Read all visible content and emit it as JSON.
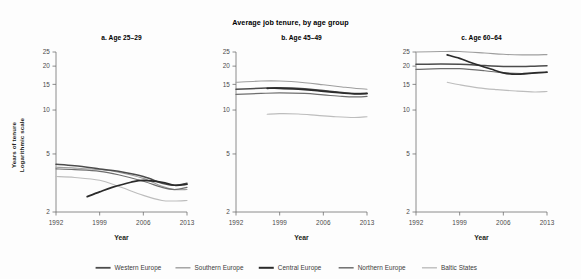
{
  "figure": {
    "title": "Average job tenure, by age group",
    "y_axis_title_line1": "Years of tenure",
    "y_axis_title_line2": "Logarithmic scale",
    "x_axis_title": "Year"
  },
  "colors": {
    "western_europe": "#4c4c4c",
    "southern_europe": "#9e9e9e",
    "central_europe": "#2b2b2b",
    "northern_europe": "#6e6e6e",
    "baltic_states": "#bdbdbd",
    "axis": "#6f6f6f",
    "text": "#231f20",
    "background": "#fdfdfd"
  },
  "legend": {
    "position": "bottom",
    "items": [
      {
        "label": "Western Europe",
        "color": "#4c4c4c",
        "width": 1.5
      },
      {
        "label": "Southern Europe",
        "color": "#9e9e9e",
        "width": 1.1
      },
      {
        "label": "Central Europe",
        "color": "#2b2b2b",
        "width": 1.7
      },
      {
        "label": "Northern Europe",
        "color": "#6e6e6e",
        "width": 1.2
      },
      {
        "label": "Baltic States",
        "color": "#bdbdbd",
        "width": 1.1
      }
    ]
  },
  "chart_data": {
    "type": "line",
    "xlabel": "Year",
    "ylabel": "Years of tenure Logarithmic scale",
    "yscale": "log",
    "xlim": [
      1992,
      2013
    ],
    "ylim": [
      2,
      25
    ],
    "xticks": [
      1992,
      1999,
      2006,
      2013
    ],
    "yticks": [
      2,
      5,
      10,
      15,
      20,
      25
    ],
    "grid": false,
    "legend_position": "bottom",
    "panels": [
      {
        "id": "a",
        "title": "a. Age 25–29",
        "series": [
          {
            "name": "Western Europe",
            "color": "#4c4c4c",
            "x": [
              1992,
              1995,
              1999,
              2002,
              2006,
              2009,
              2011,
              2013
            ],
            "values": [
              4.25,
              4.15,
              3.95,
              3.8,
              3.5,
              3.15,
              3.05,
              3.15
            ]
          },
          {
            "name": "Southern Europe",
            "color": "#9e9e9e",
            "x": [
              1992,
              1995,
              1999,
              2002,
              2006,
              2009,
              2011,
              2013
            ],
            "values": [
              4.05,
              4.0,
              3.9,
              3.75,
              3.4,
              3.0,
              2.85,
              2.85
            ]
          },
          {
            "name": "Central Europe",
            "color": "#2b2b2b",
            "x": [
              1997,
              1999,
              2001,
              2004,
              2006,
              2009,
              2011,
              2013
            ],
            "values": [
              2.55,
              2.75,
              2.95,
              3.2,
              3.3,
              3.2,
              3.05,
              3.1
            ]
          },
          {
            "name": "Northern Europe",
            "color": "#6e6e6e",
            "x": [
              1992,
              1995,
              1999,
              2002,
              2006,
              2009,
              2011,
              2013
            ],
            "values": [
              3.95,
              3.9,
              3.8,
              3.6,
              3.25,
              2.95,
              2.85,
              2.95
            ]
          },
          {
            "name": "Baltic States",
            "color": "#bdbdbd",
            "x": [
              1992,
              1995,
              1999,
              2002,
              2006,
              2009,
              2011,
              2013
            ],
            "values": [
              3.5,
              3.45,
              3.3,
              3.0,
              2.6,
              2.4,
              2.38,
              2.4
            ]
          }
        ]
      },
      {
        "id": "b",
        "title": "b. Age 45–49",
        "series": [
          {
            "name": "Western Europe",
            "color": "#4c4c4c",
            "x": [
              1992,
              1996,
              1999,
              2003,
              2006,
              2009,
              2011,
              2013
            ],
            "values": [
              13.9,
              14.1,
              14.2,
              14.0,
              13.6,
              13.2,
              13.0,
              13.0
            ]
          },
          {
            "name": "Southern Europe",
            "color": "#9e9e9e",
            "x": [
              1992,
              1996,
              1999,
              2003,
              2006,
              2009,
              2011,
              2013
            ],
            "values": [
              15.5,
              15.8,
              15.8,
              15.4,
              14.9,
              14.4,
              14.1,
              13.9
            ]
          },
          {
            "name": "Central Europe",
            "color": "#2b2b2b",
            "x": [
              1997,
              1999,
              2002,
              2005,
              2008,
              2011,
              2013
            ],
            "values": [
              14.1,
              14.1,
              13.9,
              13.6,
              13.2,
              12.9,
              13.0
            ]
          },
          {
            "name": "Northern Europe",
            "color": "#6e6e6e",
            "x": [
              1992,
              1996,
              1999,
              2003,
              2006,
              2009,
              2011,
              2013
            ],
            "values": [
              12.8,
              13.0,
              13.1,
              13.0,
              12.7,
              12.4,
              12.3,
              12.4
            ]
          },
          {
            "name": "Baltic States",
            "color": "#bdbdbd",
            "x": [
              1997,
              1999,
              2002,
              2005,
              2008,
              2011,
              2013
            ],
            "values": [
              9.35,
              9.45,
              9.4,
              9.2,
              9.0,
              8.9,
              9.0
            ]
          }
        ]
      },
      {
        "id": "c",
        "title": "c. Age 60–64",
        "series": [
          {
            "name": "Western Europe",
            "color": "#4c4c4c",
            "x": [
              1992,
              1996,
              1999,
              2003,
              2006,
              2009,
              2011,
              2013
            ],
            "values": [
              20.6,
              20.7,
              20.6,
              20.2,
              19.9,
              19.9,
              20.0,
              20.1
            ]
          },
          {
            "name": "Southern Europe",
            "color": "#9e9e9e",
            "x": [
              1992,
              1996,
              1999,
              2003,
              2006,
              2009,
              2011,
              2013
            ],
            "values": [
              25.0,
              25.2,
              25.2,
              24.6,
              24.1,
              23.9,
              23.9,
              24.0
            ]
          },
          {
            "name": "Central Europe",
            "color": "#2b2b2b",
            "x": [
              1997,
              1999,
              2001,
              2004,
              2006,
              2008,
              2011,
              2013
            ],
            "values": [
              23.9,
              22.6,
              21.0,
              19.1,
              18.0,
              17.6,
              18.0,
              18.2
            ]
          },
          {
            "name": "Northern Europe",
            "color": "#6e6e6e",
            "x": [
              1992,
              1996,
              1999,
              2003,
              2006,
              2009,
              2011,
              2013
            ],
            "values": [
              19.0,
              19.2,
              19.2,
              18.6,
              18.0,
              17.8,
              17.9,
              18.1
            ]
          },
          {
            "name": "Baltic States",
            "color": "#bdbdbd",
            "x": [
              1997,
              1999,
              2002,
              2005,
              2008,
              2011,
              2013
            ],
            "values": [
              15.5,
              14.9,
              14.2,
              13.8,
              13.5,
              13.3,
              13.4
            ]
          }
        ]
      }
    ]
  }
}
